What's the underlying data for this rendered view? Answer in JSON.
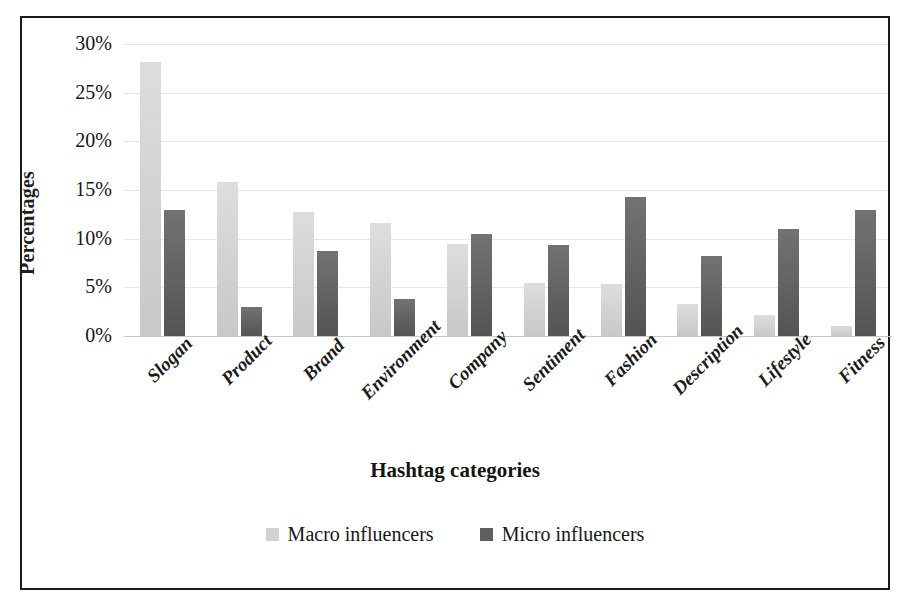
{
  "chart_data": {
    "type": "bar",
    "title": "",
    "xlabel": "Hashtag categories",
    "ylabel": "Percentages",
    "ylim": [
      0,
      30
    ],
    "yticks": [
      "0%",
      "5%",
      "10%",
      "15%",
      "20%",
      "25%",
      "30%"
    ],
    "ytick_values": [
      0,
      5,
      10,
      15,
      20,
      25,
      30
    ],
    "grid": true,
    "legend_position": "bottom-center",
    "units": "percent",
    "categories": [
      "Slogan",
      "Product",
      "Brand",
      "Environment",
      "Company",
      "Sentiment",
      "Fashion",
      "Description",
      "Lifestyle",
      "Fitness"
    ],
    "series": [
      {
        "name": "Macro influencers",
        "color": "#d2d2d2",
        "values": [
          28.2,
          15.8,
          12.7,
          11.6,
          9.5,
          5.4,
          5.3,
          3.3,
          2.2,
          1.0
        ]
      },
      {
        "name": "Micro influencers",
        "color": "#5f5f5f",
        "values": [
          12.9,
          3.0,
          8.7,
          3.8,
          10.5,
          9.4,
          14.3,
          8.2,
          11.0,
          12.9
        ]
      }
    ]
  },
  "legend": {
    "items": [
      {
        "label": "Macro influencers",
        "swatch": "macro"
      },
      {
        "label": "Micro influencers",
        "swatch": "micro"
      }
    ]
  }
}
